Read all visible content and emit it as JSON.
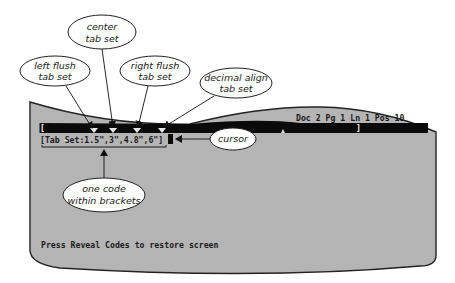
{
  "figure": {
    "colors": {
      "screen_fill": "#b4b4b4",
      "screen_border": "#1e1e1e",
      "bar": "#0a0a0a",
      "callout_fill": "#ffffff",
      "callout_stroke": "#222222"
    }
  },
  "status_line": {
    "text": "Doc 2 Pg 1 Ln 1 Pos 10",
    "doc": "2",
    "page": "1",
    "line": "1",
    "pos": "10"
  },
  "ruler_bar": {
    "left_bracket": "[",
    "right_bracket": "]"
  },
  "code_line": {
    "text": "[Tab Set:1.5\",3\",4.8\",6\"]",
    "tab_stops": [
      "1.5\"",
      "3\"",
      "4.8\"",
      "6\""
    ]
  },
  "prompt_line": {
    "text": "Press Reveal Codes to restore screen"
  },
  "callouts": {
    "left_flush": {
      "line1": "left flush",
      "line2": "tab set"
    },
    "center": {
      "line1": "center",
      "line2": "tab set"
    },
    "right_flush": {
      "line1": "right flush",
      "line2": "tab set"
    },
    "decimal_align": {
      "line1": "decimal align",
      "line2": "tab set"
    },
    "cursor": {
      "line1": "cursor"
    },
    "one_code": {
      "line1": "one code",
      "line2": "within brackets"
    }
  }
}
